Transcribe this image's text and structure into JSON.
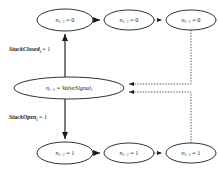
{
  "diagram": {
    "colors": {
      "stroke": "#1a1a1a",
      "dotted_stroke": "#3a3a3a",
      "background": "#ffffff"
    },
    "nodes": [
      {
        "id": "top-left",
        "var": "n",
        "var_sub": "i+1",
        "operator": " = ",
        "value": "0",
        "cx": 65,
        "cy": 20,
        "rx": 28,
        "ry": 11
      },
      {
        "id": "top-middle",
        "var": "n",
        "var_sub": "i+1",
        "operator": " = ",
        "value": "0",
        "cx": 129,
        "cy": 20,
        "rx": 25,
        "ry": 10
      },
      {
        "id": "top-right",
        "var": "n",
        "var_sub": "i+1",
        "operator": " = ",
        "value": "0",
        "cx": 191,
        "cy": 20,
        "rx": 25,
        "ry": 10
      },
      {
        "id": "middle",
        "var": "n",
        "var_sub": "i+1",
        "operator": " = ",
        "value": "ValveSignal",
        "value_sub": "i",
        "cx": 69,
        "cy": 88,
        "rx": 55,
        "ry": 11
      },
      {
        "id": "bottom-left",
        "var": "n",
        "var_sub": "i+1",
        "operator": " = ",
        "value": "1",
        "cx": 65,
        "cy": 153,
        "rx": 28,
        "ry": 11
      },
      {
        "id": "bottom-middle",
        "var": "n",
        "var_sub": "i+1",
        "operator": " = ",
        "value": "1",
        "cx": 129,
        "cy": 153,
        "rx": 25,
        "ry": 10
      },
      {
        "id": "bottom-right",
        "var": "n",
        "var_sub": "i+1",
        "operator": " = ",
        "value": "1",
        "cx": 191,
        "cy": 153,
        "rx": 25,
        "ry": 10
      }
    ],
    "edge_labels": [
      {
        "id": "stuck-closed",
        "name": "StuckClosed",
        "name_sub": "i",
        "operator": " = ",
        "value": "1",
        "x": 9,
        "y": 50
      },
      {
        "id": "stuck-open",
        "name": "StuckOpen",
        "name_sub": "i",
        "operator": " = ",
        "value": "1",
        "x": 9,
        "y": 118
      }
    ],
    "edges": [
      {
        "id": "middle-to-top-left",
        "style": "solid",
        "direction": "up"
      },
      {
        "id": "middle-to-bottom-left",
        "style": "solid",
        "direction": "down"
      },
      {
        "id": "top-left-to-top-middle",
        "style": "solid",
        "direction": "right"
      },
      {
        "id": "top-middle-to-top-right",
        "style": "dotted",
        "direction": "right"
      },
      {
        "id": "bottom-left-to-bottom-middle",
        "style": "solid",
        "direction": "right"
      },
      {
        "id": "bottom-middle-to-bottom-right",
        "style": "dotted",
        "direction": "right"
      },
      {
        "id": "top-right-to-middle",
        "style": "dotted",
        "direction": "feedback"
      },
      {
        "id": "bottom-right-to-middle",
        "style": "dotted",
        "direction": "feedback"
      }
    ]
  }
}
